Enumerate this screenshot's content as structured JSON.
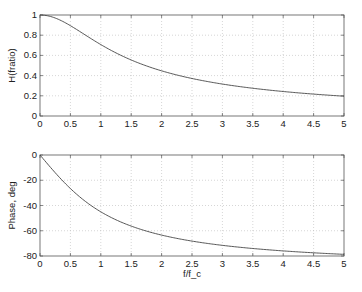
{
  "chart_data": [
    {
      "type": "line",
      "title": "",
      "xlabel": "",
      "ylabel": "H(fratio)",
      "xlim": [
        0,
        5
      ],
      "ylim": [
        0,
        1
      ],
      "xticks": [
        "0",
        "0.5",
        "1",
        "1.5",
        "2",
        "2.5",
        "3",
        "3.5",
        "4",
        "4.5",
        "5"
      ],
      "yticks": [
        "0",
        "0.2",
        "0.4",
        "0.6",
        "0.8",
        "1"
      ],
      "grid": true,
      "series": [
        {
          "name": "magnitude",
          "x": [
            0,
            0.25,
            0.5,
            0.75,
            1,
            1.25,
            1.5,
            1.75,
            2,
            2.5,
            3,
            3.5,
            4,
            4.5,
            5
          ],
          "y": [
            1.0,
            0.97,
            0.894,
            0.8,
            0.707,
            0.625,
            0.555,
            0.496,
            0.447,
            0.371,
            0.316,
            0.275,
            0.243,
            0.217,
            0.196
          ]
        }
      ]
    },
    {
      "type": "line",
      "title": "",
      "xlabel": "f/f_c",
      "ylabel": "Phase, deg",
      "xlim": [
        0,
        5
      ],
      "ylim": [
        -80,
        0
      ],
      "xticks": [
        "0",
        "0.5",
        "1",
        "1.5",
        "2",
        "2.5",
        "3",
        "3.5",
        "4",
        "4.5",
        "5"
      ],
      "yticks": [
        "0",
        "-20",
        "-40",
        "-60",
        "-80"
      ],
      "grid": true,
      "series": [
        {
          "name": "phase",
          "x": [
            0,
            0.25,
            0.5,
            0.75,
            1,
            1.25,
            1.5,
            1.75,
            2,
            2.5,
            3,
            3.5,
            4,
            4.5,
            5
          ],
          "y": [
            0,
            -14.0,
            -26.6,
            -36.9,
            -45.0,
            -51.3,
            -56.3,
            -60.3,
            -63.4,
            -68.2,
            -71.6,
            -74.1,
            -76.0,
            -77.5,
            -78.7
          ]
        }
      ]
    }
  ]
}
